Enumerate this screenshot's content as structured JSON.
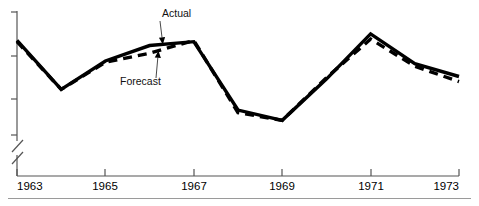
{
  "chart_data": {
    "type": "line",
    "title": "",
    "xlabel": "",
    "ylabel": "",
    "grid": false,
    "legend_position": "inline-annotations",
    "x": [
      1963,
      1964,
      1965,
      1966,
      1967,
      1968,
      1969,
      1970,
      1971,
      1972,
      1973
    ],
    "xlim": [
      1963,
      1973
    ],
    "ylim": [
      0,
      100
    ],
    "y_axis_broken": true,
    "y_axis_tick_count": 4,
    "y_axis_labeled": false,
    "xticks": [
      1963,
      1965,
      1967,
      1969,
      1971,
      1973
    ],
    "xtick_labels": [
      "1963",
      "1965",
      "1967",
      "1969",
      "1971",
      "1973"
    ],
    "series": [
      {
        "name": "Actual",
        "style": "solid",
        "color": "#000000",
        "values": [
          78,
          40,
          62,
          74,
          77,
          24,
          16,
          48,
          83,
          60,
          50
        ]
      },
      {
        "name": "Forecast",
        "style": "dashed",
        "color": "#000000",
        "values": [
          77,
          40,
          61,
          68,
          78,
          22,
          16,
          49,
          79,
          58,
          46
        ]
      }
    ],
    "annotations": [
      {
        "text": "Actual",
        "points_to_year": 1966.3,
        "series": "Actual"
      },
      {
        "text": "Forecast",
        "points_to_year": 1966.2,
        "series": "Forecast"
      }
    ]
  },
  "axis": {
    "tick_labels": [
      "1963",
      "1965",
      "1967",
      "1969",
      "1971",
      "1973"
    ],
    "break_symbol": "axis-break-slashes"
  },
  "annotations": {
    "actual": "Actual",
    "forecast": "Forecast"
  },
  "colors": {
    "line": "#000000",
    "axis": "#555555",
    "rule": "#9a9a9a",
    "text": "#000000"
  }
}
